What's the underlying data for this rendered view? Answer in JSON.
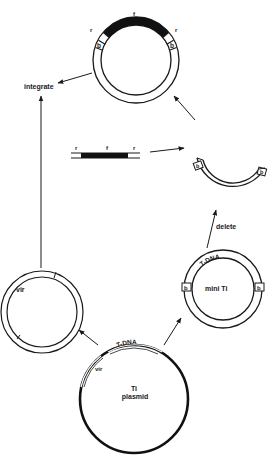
{
  "diagram": {
    "colors": {
      "ink": "#1a1a1a",
      "background": "#ffffff"
    },
    "top_plasmid": {
      "labels": {
        "r_left": "r",
        "f": "f",
        "r_right": "r",
        "b_left": "b",
        "b_right": "b"
      }
    },
    "integrate_label": "integrate",
    "linear_fragment": {
      "labels": {
        "r_left": "r",
        "f": "f",
        "r_right": "r"
      }
    },
    "deleted_plasmid": {
      "labels": {
        "b_left": "b",
        "b_right": "b"
      }
    },
    "delete_label": "delete",
    "vir_plasmid": {
      "label": "vir"
    },
    "mini_ti_plasmid": {
      "label": "mini Ti",
      "tdna_label": "T-DNA",
      "b_left": "b",
      "b_right": "b"
    },
    "ti_plasmid": {
      "label_line1": "Ti",
      "label_line2": "plasmid",
      "tdna_label": "T-DNA",
      "vir_label": "vir"
    }
  }
}
